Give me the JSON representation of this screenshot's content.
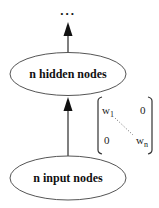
{
  "diagram": {
    "continuation": "...",
    "hidden_layer": {
      "label": "n hidden nodes"
    },
    "input_layer": {
      "label": "n input nodes"
    },
    "weight_matrix": {
      "top_left": "w",
      "top_left_sub": "1",
      "top_right": "0",
      "bottom_left": "0",
      "bottom_right": "w",
      "bottom_right_sub": "n"
    },
    "edges": [
      {
        "from": "input_layer",
        "to": "hidden_layer"
      },
      {
        "from": "hidden_layer",
        "to": "continuation"
      }
    ],
    "colors": {
      "line": "#555555",
      "text": "#111111",
      "background": "#ffffff"
    }
  }
}
